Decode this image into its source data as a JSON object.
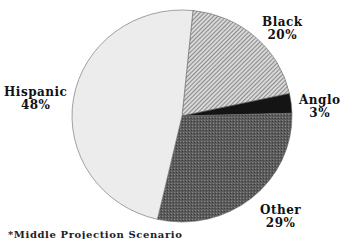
{
  "chart_data": {
    "type": "pie",
    "title": "",
    "slices": [
      {
        "label": "Black",
        "value": 20,
        "display": "20%",
        "fill": "#b8b8b8",
        "pattern": "diagonal-hatch"
      },
      {
        "label": "Anglo",
        "value": 3,
        "display": "3%",
        "fill": "#141414",
        "pattern": "solid"
      },
      {
        "label": "Other",
        "value": 29,
        "display": "29%",
        "fill": "#5a5a5a",
        "pattern": "dense-stipple"
      },
      {
        "label": "Hispanic",
        "value": 48,
        "display": "48%",
        "fill": "#ececec",
        "pattern": "light-stipple"
      }
    ],
    "footnote": "*Middle Projection Scenario"
  },
  "labels": {
    "black": {
      "name": "Black",
      "pct": "20%"
    },
    "anglo": {
      "name": "Anglo",
      "pct": "3%"
    },
    "other": {
      "name": "Other",
      "pct": "29%"
    },
    "hispanic": {
      "name": "Hispanic",
      "pct": "48%"
    }
  },
  "footnote": "*Middle Projection Scenario"
}
